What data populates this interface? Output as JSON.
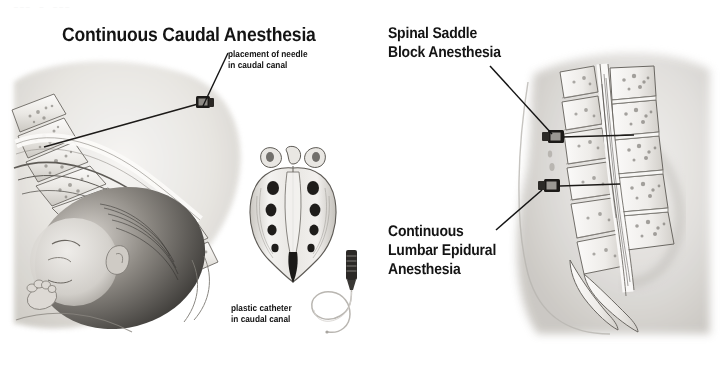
{
  "page": {
    "width": 724,
    "height": 375,
    "background": "#ffffff",
    "ink": "#141414",
    "faint_top_marks": "___  _  ___"
  },
  "titles": {
    "left_panel_title": "Continuous Caudal Anesthesia",
    "right_upper_title_line1": "Spinal Saddle",
    "right_upper_title_line2": "Block Anesthesia",
    "right_lower_title_line1": "Continuous",
    "right_lower_title_line2": "Lumbar Epidural",
    "right_lower_title_line3": "Anesthesia"
  },
  "callouts": {
    "needle_caption_line1": "placement of needle",
    "needle_caption_line2": "in caudal canal",
    "catheter_caption_line1": "plastic catheter",
    "catheter_caption_line2": "in caudal canal"
  },
  "figures": {
    "left": {
      "name": "caudal-anesthesia-sagittal-section",
      "description": "Sagittal section of maternal pelvis with fetal head in birth canal, sacral vertebrae and needle in caudal canal"
    },
    "center": {
      "name": "sacrum-posterior-view",
      "description": "Posterior view of sacrum showing sacral foramina and hiatus"
    },
    "center_device": {
      "name": "plastic-catheter-and-needle-hub",
      "description": "Needle hub with coiled plastic catheter"
    },
    "right": {
      "name": "lumbar-spine-sagittal-section",
      "description": "Sagittal section of lumbar spine and sacrum with two needles; upper needle for spinal saddle block, lower needle for continuous lumbar epidural"
    }
  },
  "colors": {
    "ink": "#141414",
    "bone_light": "#f2f1ef",
    "bone_mid": "#d9d7d3",
    "bone_dark": "#a8a49e",
    "tissue": "#e3e1de",
    "skin_shadow": "#cfccc7",
    "hair_dark": "#3a3836",
    "needle_metal": "#2a2826"
  }
}
